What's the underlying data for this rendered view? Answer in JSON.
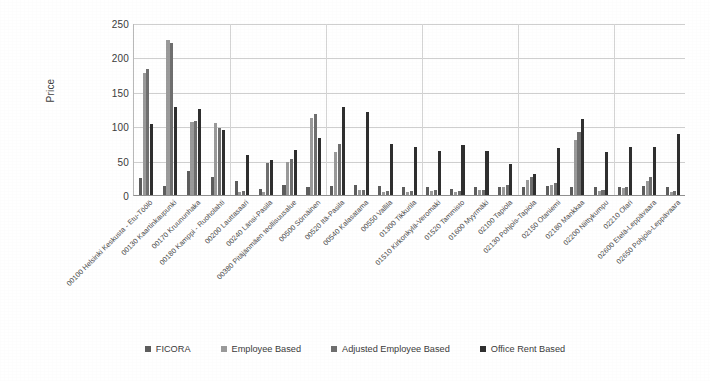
{
  "chart_data": {
    "type": "bar",
    "title": "",
    "xlabel": "",
    "ylabel": "Price",
    "ylim": [
      0,
      250
    ],
    "yticks": [
      250,
      200,
      150,
      100,
      50,
      0
    ],
    "grid": true,
    "legend_position": "bottom",
    "categories": [
      "00100 Helsinki Keskusta - Etu-Töölö",
      "00130 Kaartinkaupunki",
      "00170 Kruununhaka",
      "00180 Kamppi - Ruoholahti",
      "00200 Lauttasaari",
      "00240 Länsi-Pasila",
      "00380 Pitäjänmäen teollisuusalue",
      "00500 Sörnäinen",
      "00520 Itä-Pasila",
      "00540 Kalasatama",
      "00550 Vallila",
      "01300 Tikkurila",
      "01510 Kirkonkylä-Veromaki",
      "01520 Tammisto",
      "01600 Myyrmäki",
      "02100 Tapiola",
      "02130 Pohjois-Tapiola",
      "02150 Otaniemi",
      "02180 Mankkaa",
      "02200 Niittykumpu",
      "02210 Olari",
      "02600 Etelä-Leppävaara",
      "02650 Pohjois-Leppävaara"
    ],
    "series": [
      {
        "name": "FICORA",
        "color": "#5d5d5d",
        "values": [
          25,
          13,
          35,
          26,
          20,
          9,
          14,
          12,
          13,
          15,
          13,
          11,
          11,
          9,
          12,
          11,
          11,
          13,
          12,
          11,
          12,
          13,
          11
        ]
      },
      {
        "name": "Employee Based",
        "color": "#9a9a9a",
        "values": [
          178,
          226,
          106,
          104,
          4,
          5,
          48,
          112,
          63,
          7,
          5,
          5,
          6,
          5,
          7,
          12,
          22,
          14,
          80,
          6,
          10,
          21,
          5
        ]
      },
      {
        "name": "Adjusted Employee Based",
        "color": "#6f6f6f",
        "values": [
          183,
          221,
          108,
          97,
          6,
          47,
          52,
          118,
          74,
          8,
          6,
          6,
          7,
          6,
          8,
          14,
          26,
          17,
          92,
          7,
          12,
          26,
          6
        ]
      },
      {
        "name": "Office Rent Based",
        "color": "#2f2f2f",
        "values": [
          103,
          128,
          125,
          95,
          58,
          51,
          66,
          83,
          128,
          121,
          74,
          70,
          64,
          72,
          64,
          45,
          31,
          68,
          111,
          62,
          70,
          70,
          88
        ]
      }
    ]
  },
  "legend": {
    "items": [
      {
        "label": "FICORA",
        "color": "#5d5d5d"
      },
      {
        "label": "Employee Based",
        "color": "#9a9a9a"
      },
      {
        "label": "Adjusted Employee Based",
        "color": "#6f6f6f"
      },
      {
        "label": "Office Rent Based",
        "color": "#2f2f2f"
      }
    ]
  }
}
